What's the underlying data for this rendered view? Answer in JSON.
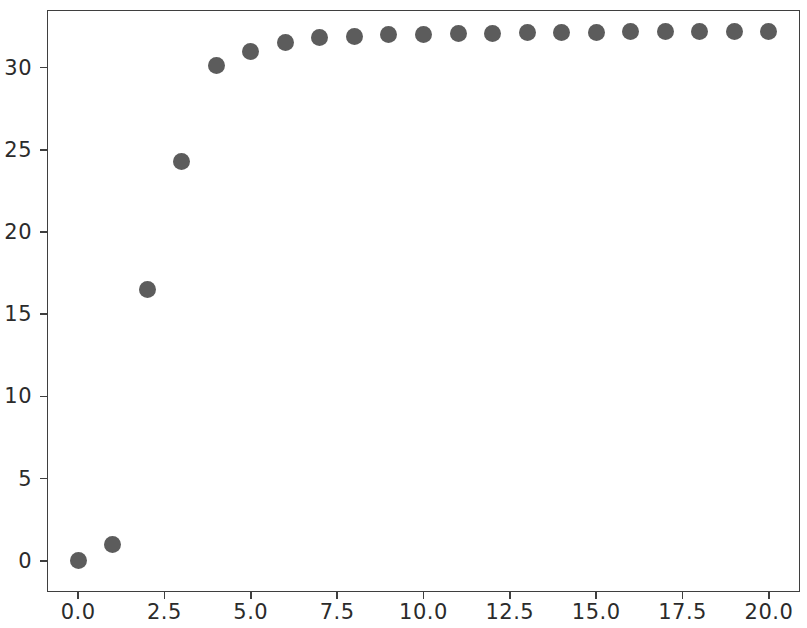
{
  "chart_data": {
    "type": "scatter",
    "title": "",
    "xlabel": "",
    "ylabel": "",
    "xlim": [
      -0.9,
      20.9
    ],
    "ylim": [
      -1.9,
      33.5
    ],
    "grid": false,
    "legend": null,
    "marker": {
      "shape": "circle",
      "color": "#5c5c5c",
      "size_px": 17
    },
    "axis_color": "#3f3f3f",
    "background_color": "#ffffff",
    "xticks": [
      0.0,
      2.5,
      5.0,
      7.5,
      10.0,
      12.5,
      15.0,
      17.5,
      20.0
    ],
    "xticklabels": [
      "0.0",
      "2.5",
      "5.0",
      "7.5",
      "10.0",
      "12.5",
      "15.0",
      "17.5",
      "20.0"
    ],
    "yticks": [
      0,
      5,
      10,
      15,
      20,
      25,
      30
    ],
    "yticklabels": [
      "0",
      "5",
      "10",
      "15",
      "20",
      "25",
      "30"
    ],
    "x": [
      0,
      1,
      2,
      3,
      4,
      5,
      6,
      7,
      8,
      9,
      10,
      11,
      12,
      13,
      14,
      15,
      16,
      17,
      18,
      19,
      20
    ],
    "y": [
      0.0,
      1.0,
      16.5,
      24.3,
      30.1,
      31.0,
      31.5,
      31.8,
      31.9,
      32.0,
      32.0,
      32.05,
      32.1,
      32.15,
      32.15,
      32.15,
      32.2,
      32.2,
      32.2,
      32.2,
      32.2
    ]
  }
}
